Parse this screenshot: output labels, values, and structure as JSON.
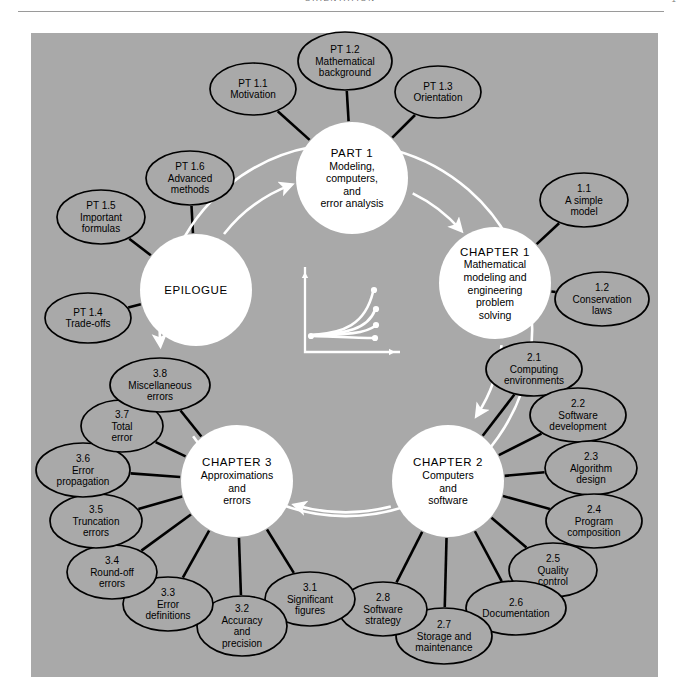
{
  "header": {
    "running_head": "ORIENTATION",
    "folio": "1",
    "rule_color": "#9a9a9a"
  },
  "figure": {
    "background_color": "#a9a9a9",
    "node_fill": "#ffffff",
    "node_stroke": "#000000",
    "flow_arrow_color": "#ffffff",
    "connector_color": "#000000",
    "center_icon": {
      "name": "growth-curves-icon",
      "description": "white axes with four curves fanning from origin, each ending in a dot",
      "curve_count": 4,
      "color": "#ffffff"
    }
  },
  "hubs": [
    {
      "id": "part-1",
      "title": "PART 1",
      "lines": [
        "Modeling,",
        "computers,",
        "and",
        "error analysis"
      ],
      "cx": 352,
      "cy": 178,
      "r": 56
    },
    {
      "id": "chapter-1",
      "title": "CHAPTER 1",
      "lines": [
        "Mathematical",
        "modeling and",
        "engineering",
        "problem",
        "solving"
      ],
      "cx": 495,
      "cy": 283,
      "r": 56
    },
    {
      "id": "chapter-2",
      "title": "CHAPTER 2",
      "lines": [
        "Computers",
        "and",
        "software"
      ],
      "cx": 448,
      "cy": 481,
      "r": 56
    },
    {
      "id": "chapter-3",
      "title": "CHAPTER 3",
      "lines": [
        "Approximations",
        "and",
        "errors"
      ],
      "cx": 237,
      "cy": 481,
      "r": 56
    },
    {
      "id": "epilogue",
      "title": "EPILOGUE",
      "lines": [],
      "cx": 196,
      "cy": 290,
      "r": 56
    }
  ],
  "leaves": [
    {
      "id": "pt-1-1",
      "num": "PT 1.1",
      "lines": [
        "Motivation"
      ],
      "cx": 253,
      "cy": 89,
      "rx": 43,
      "ry": 26,
      "parent": "part-1"
    },
    {
      "id": "pt-1-2",
      "num": "PT 1.2",
      "lines": [
        "Mathematical",
        "background"
      ],
      "cx": 345,
      "cy": 61,
      "rx": 47,
      "ry": 29,
      "parent": "part-1"
    },
    {
      "id": "pt-1-3",
      "num": "PT 1.3",
      "lines": [
        "Orientation"
      ],
      "cx": 438,
      "cy": 92,
      "rx": 43,
      "ry": 26,
      "parent": "part-1"
    },
    {
      "id": "pt-1-6",
      "num": "PT 1.6",
      "lines": [
        "Advanced",
        "methods"
      ],
      "cx": 190,
      "cy": 178,
      "rx": 44,
      "ry": 27,
      "parent": "epilogue"
    },
    {
      "id": "pt-1-5",
      "num": "PT 1.5",
      "lines": [
        "Important",
        "formulas"
      ],
      "cx": 101,
      "cy": 217,
      "rx": 44,
      "ry": 27,
      "parent": "epilogue"
    },
    {
      "id": "pt-1-4",
      "num": "PT 1.4",
      "lines": [
        "Trade-offs"
      ],
      "cx": 88,
      "cy": 318,
      "rx": 43,
      "ry": 25,
      "parent": "epilogue"
    },
    {
      "id": "ch-1-1",
      "num": "1.1",
      "lines": [
        "A simple",
        "model"
      ],
      "cx": 584,
      "cy": 200,
      "rx": 44,
      "ry": 27,
      "parent": "chapter-1"
    },
    {
      "id": "ch-1-2",
      "num": "1.2",
      "lines": [
        "Conservation",
        "laws"
      ],
      "cx": 602,
      "cy": 299,
      "rx": 47,
      "ry": 27,
      "parent": "chapter-1"
    },
    {
      "id": "ch-2-1",
      "num": "2.1",
      "lines": [
        "Computing",
        "environments"
      ],
      "cx": 534,
      "cy": 369,
      "rx": 48,
      "ry": 27,
      "parent": "chapter-2"
    },
    {
      "id": "ch-2-2",
      "num": "2.2",
      "lines": [
        "Software",
        "development"
      ],
      "cx": 578,
      "cy": 415,
      "rx": 48,
      "ry": 27,
      "parent": "chapter-2"
    },
    {
      "id": "ch-2-3",
      "num": "2.3",
      "lines": [
        "Algorithm",
        "design"
      ],
      "cx": 591,
      "cy": 468,
      "rx": 46,
      "ry": 27,
      "parent": "chapter-2"
    },
    {
      "id": "ch-2-4",
      "num": "2.4",
      "lines": [
        "Program",
        "composition"
      ],
      "cx": 594,
      "cy": 521,
      "rx": 48,
      "ry": 27,
      "parent": "chapter-2"
    },
    {
      "id": "ch-2-5",
      "num": "2.5",
      "lines": [
        "Quality",
        "control"
      ],
      "cx": 553,
      "cy": 570,
      "rx": 44,
      "ry": 27,
      "parent": "chapter-2"
    },
    {
      "id": "ch-2-6",
      "num": "2.6",
      "lines": [
        "Documentation"
      ],
      "cx": 516,
      "cy": 608,
      "rx": 50,
      "ry": 27,
      "parent": "chapter-2"
    },
    {
      "id": "ch-2-7",
      "num": "2.7",
      "lines": [
        "Storage and",
        "maintenance"
      ],
      "cx": 444,
      "cy": 636,
      "rx": 48,
      "ry": 28,
      "parent": "chapter-2"
    },
    {
      "id": "ch-2-8",
      "num": "2.8",
      "lines": [
        "Software",
        "strategy"
      ],
      "cx": 383,
      "cy": 609,
      "rx": 44,
      "ry": 27,
      "parent": "chapter-2"
    },
    {
      "id": "ch-3-1",
      "num": "3.1",
      "lines": [
        "Significant",
        "figures"
      ],
      "cx": 310,
      "cy": 599,
      "rx": 45,
      "ry": 27,
      "parent": "chapter-3"
    },
    {
      "id": "ch-3-2",
      "num": "3.2",
      "lines": [
        "Accuracy",
        "and",
        "precision"
      ],
      "cx": 242,
      "cy": 626,
      "rx": 45,
      "ry": 30,
      "parent": "chapter-3"
    },
    {
      "id": "ch-3-3",
      "num": "3.3",
      "lines": [
        "Error",
        "definitions"
      ],
      "cx": 168,
      "cy": 604,
      "rx": 45,
      "ry": 27,
      "parent": "chapter-3"
    },
    {
      "id": "ch-3-4",
      "num": "3.4",
      "lines": [
        "Round-off",
        "errors"
      ],
      "cx": 112,
      "cy": 572,
      "rx": 45,
      "ry": 27,
      "parent": "chapter-3"
    },
    {
      "id": "ch-3-5",
      "num": "3.5",
      "lines": [
        "Truncation",
        "errors"
      ],
      "cx": 96,
      "cy": 521,
      "rx": 46,
      "ry": 27,
      "parent": "chapter-3"
    },
    {
      "id": "ch-3-6",
      "num": "3.6",
      "lines": [
        "Error",
        "propagation"
      ],
      "cx": 83,
      "cy": 470,
      "rx": 47,
      "ry": 27,
      "parent": "chapter-3"
    },
    {
      "id": "ch-3-7",
      "num": "3.7",
      "lines": [
        "Total",
        "error"
      ],
      "cx": 122,
      "cy": 426,
      "rx": 41,
      "ry": 26,
      "parent": "chapter-3"
    },
    {
      "id": "ch-3-8",
      "num": "3.8",
      "lines": [
        "Miscellaneous",
        "errors"
      ],
      "cx": 160,
      "cy": 385,
      "rx": 50,
      "ry": 27,
      "parent": "chapter-3"
    }
  ],
  "flow_arrows": [
    {
      "id": "epilogue-to-part1",
      "from": "epilogue",
      "to": "part-1"
    },
    {
      "id": "part1-to-chapter1",
      "from": "part-1",
      "to": "chapter-1"
    },
    {
      "id": "chapter1-to-chapter2",
      "from": "chapter-1",
      "to": "chapter-2"
    },
    {
      "id": "chapter2-to-chapter3",
      "from": "chapter-2",
      "to": "chapter-3"
    },
    {
      "id": "chapter3-to-epilogue",
      "from": "chapter-3",
      "to": "epilogue"
    }
  ]
}
